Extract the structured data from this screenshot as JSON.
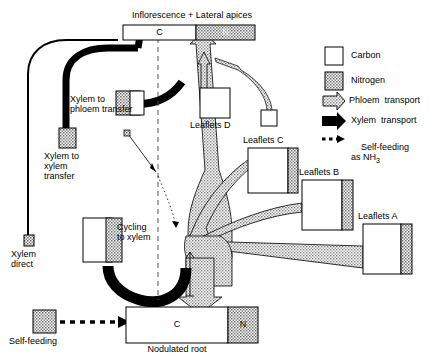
{
  "figure": {
    "type": "flow-diagram"
  },
  "labels": {
    "inflorescence": "Inflorescence + Lateral apices",
    "nodulated_root": "Nodulated root",
    "leaflets_a": "Leaflets A",
    "leaflets_b": "Leaflets B",
    "leaflets_c": "Leaflets C",
    "leaflets_d": "Leaflets D",
    "xylem_to_phloem": "Xylem to\nphloem transfer",
    "xylem_to_xylem": "Xylem to\nxylem\ntransfer",
    "xylem_direct": "Xylem\ndirect",
    "cycling_to_xylem": "Cycling\nto xylem",
    "self_feeding": "Self-feeding"
  },
  "compartment_letters": {
    "carbon": "C",
    "nitrogen": "N"
  },
  "boxes": [
    {
      "name": "inflorescence-bar",
      "c_letter": "C",
      "n_letter": "N"
    },
    {
      "name": "nodulated-root-bar",
      "c_letter": "C",
      "n_letter": "N"
    },
    {
      "name": "leaflets-a-box",
      "label": "Leaflets A"
    },
    {
      "name": "leaflets-b-box",
      "label": "Leaflets B"
    },
    {
      "name": "leaflets-c-box",
      "label": "Leaflets C"
    },
    {
      "name": "leaflets-d-box",
      "label": "Leaflets D"
    },
    {
      "name": "cycling-to-xylem-box",
      "label": "Cycling to xylem"
    },
    {
      "name": "xylem-to-phloem-transfer-box",
      "label": "Xylem to phloem transfer"
    },
    {
      "name": "xylem-to-xylem-transfer-box",
      "label": "Xylem to xylem transfer"
    },
    {
      "name": "xylem-direct-marker",
      "label": "Xylem direct"
    },
    {
      "name": "self-feeding-box",
      "label": "Self-feeding"
    }
  ],
  "legend": {
    "items": [
      {
        "key": "carbon",
        "label": "Carbon",
        "swatch": "white-square"
      },
      {
        "key": "nitrogen",
        "label": "Nitrogen",
        "swatch": "stippled-square"
      },
      {
        "key": "phloem_transport",
        "label": "Phloem  transport",
        "swatch": "stippled-arrow"
      },
      {
        "key": "xylem_transport",
        "label": "Xylem  transport",
        "swatch": "black-arrow"
      },
      {
        "key": "self_feeding",
        "label": "Self-feeding\nas NH",
        "sub": "3",
        "swatch": "dotted-arrow"
      }
    ]
  },
  "colors": {
    "ink": "#000000",
    "carbon_fill": "#ffffff",
    "nitrogen_fill": "#b8b8b8",
    "phloem_fill": "#c9c9c9",
    "xylem_fill": "#000000"
  }
}
